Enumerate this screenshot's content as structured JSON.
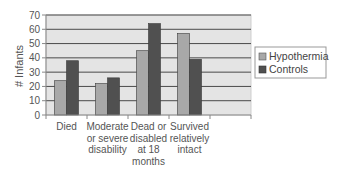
{
  "chart_data": {
    "type": "bar",
    "title": "",
    "xlabel": "",
    "ylabel": "# Infants",
    "ylim": [
      0,
      70
    ],
    "yticks": [
      0,
      10,
      20,
      30,
      40,
      50,
      60,
      70
    ],
    "grid": true,
    "legend_position": "right",
    "categories": [
      [
        "Died"
      ],
      [
        "Moderate",
        "or severe",
        "disability"
      ],
      [
        "Dead or",
        "disabled",
        "at 18",
        "months"
      ],
      [
        "Survived",
        "relatively",
        "intact"
      ],
      [
        ""
      ]
    ],
    "series": [
      {
        "name": "Hypothermia",
        "color": "#a8a8a8",
        "values": [
          24,
          22,
          45,
          57,
          null
        ]
      },
      {
        "name": "Controls",
        "color": "#505050",
        "values": [
          38,
          26,
          64,
          39,
          null
        ]
      }
    ]
  },
  "colors": {
    "plot_background": "#e4e4e4",
    "gridline": "#4a4a4a",
    "axis": "#888888"
  }
}
